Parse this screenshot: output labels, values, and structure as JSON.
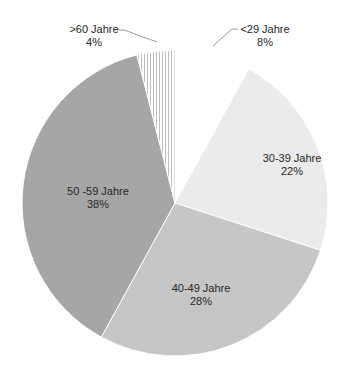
{
  "chart_data": {
    "type": "pie",
    "title": "",
    "categories": [
      "<29 Jahre",
      "30-39 Jahre",
      "40-49 Jahre",
      "50 -59 Jahre",
      ">60 Jahre"
    ],
    "values": [
      8,
      22,
      28,
      38,
      4
    ],
    "unit": "%",
    "start_angle_deg": 0,
    "direction": "clockwise",
    "legend": "none (data labels on slices)",
    "slices": [
      {
        "label": "<29 Jahre",
        "value": 8,
        "value_label": "8%",
        "fill": "#ffffff",
        "pattern": "none",
        "label_position": "outside-leader"
      },
      {
        "label": "30-39 Jahre",
        "value": 22,
        "value_label": "22%",
        "fill": "#ebebeb",
        "pattern": "none",
        "label_position": "inside"
      },
      {
        "label": "40-49 Jahre",
        "value": 28,
        "value_label": "28%",
        "fill": "#c6c6c6",
        "pattern": "none",
        "label_position": "inside"
      },
      {
        "label": "50 -59 Jahre",
        "value": 38,
        "value_label": "38%",
        "fill": "#a6a6a6",
        "pattern": "none",
        "label_position": "inside"
      },
      {
        "label": ">60 Jahre",
        "value": 4,
        "value_label": "4%",
        "fill": "#ffffff",
        "pattern": "vertical-stripes",
        "label_position": "outside-leader"
      }
    ]
  },
  "labels": {
    "lt29": {
      "name": "<29 Jahre",
      "pct": "8%"
    },
    "a30_39": {
      "name": "30-39 Jahre",
      "pct": "22%"
    },
    "a40_49": {
      "name": "40-49 Jahre",
      "pct": "28%"
    },
    "a50_59": {
      "name": "50 -59 Jahre",
      "pct": "38%"
    },
    "gt60": {
      "name": ">60 Jahre",
      "pct": "4%"
    }
  }
}
